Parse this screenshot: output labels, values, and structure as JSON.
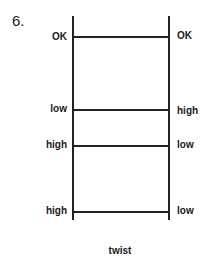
{
  "figure": {
    "number": "6.",
    "caption": "twist",
    "rows": [
      {
        "left": "OK",
        "right": "OK"
      },
      {
        "left": "low",
        "right": "high"
      },
      {
        "left": "high",
        "right": "low"
      },
      {
        "left": "high",
        "right": "low"
      }
    ]
  }
}
